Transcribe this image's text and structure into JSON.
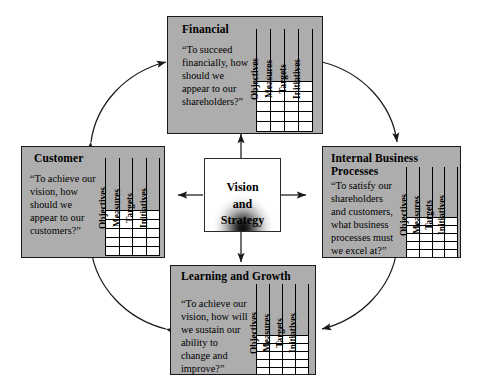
{
  "diagram": {
    "center": {
      "label": "Vision\nand\nStrategy",
      "line1": "Vision",
      "line2": "and",
      "line3": "Strategy"
    },
    "table_headers": [
      "Objectives",
      "Measures",
      "Targets",
      "Initiatives"
    ],
    "table_rows": 5,
    "perspectives": [
      {
        "id": "financial",
        "title": "Financial",
        "question": "“To succeed\nfinancially, how\nshould we\nappear to our\nshareholders?”"
      },
      {
        "id": "customer",
        "title": "Customer",
        "question": "“To achieve our\nvision, how\nshould we\nappear to our\ncustomers?”"
      },
      {
        "id": "internal-business-processes",
        "title": "Internal Business\nProcesses",
        "question": "“To satisfy our\nshareholders\nand customers,\nwhat business\nprocesses must\nwe excel at?”"
      },
      {
        "id": "learning-and-growth",
        "title": "Learning and\nGrowth",
        "question": "“To achieve our\nvision, how will\nwe sustain our\nability to\nchange and\nimprove?”"
      }
    ],
    "colors": {
      "box_fill": "#adadad",
      "box_border": "#1a1a1a",
      "cell_fill": "#ffffff",
      "center_fill": "#ffffff",
      "arrow": "#1a1a1a",
      "background": "#ffffff"
    }
  }
}
